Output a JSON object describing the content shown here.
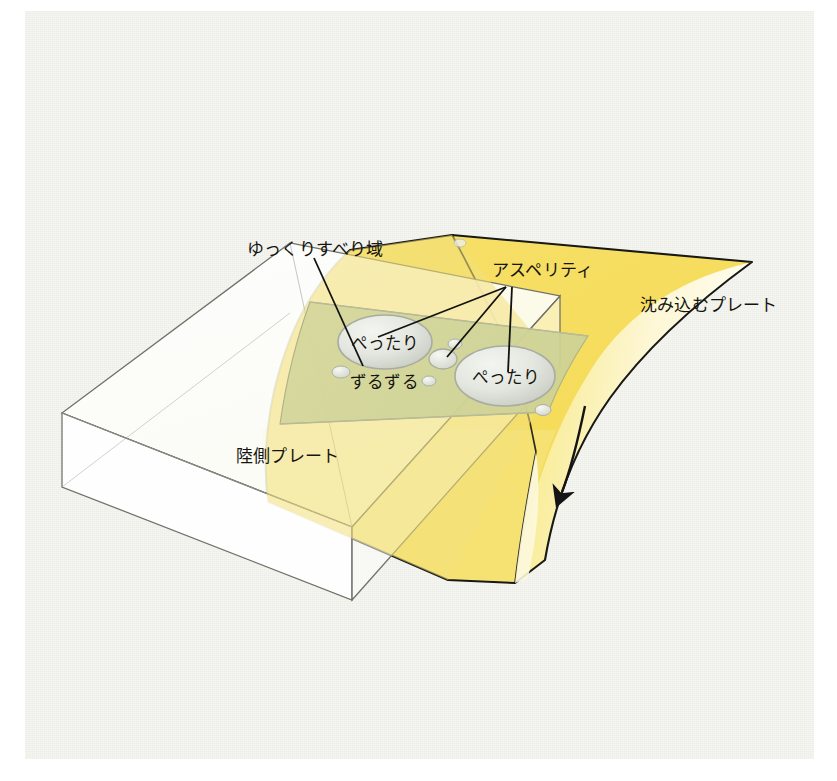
{
  "figure": {
    "title_visible": false,
    "background_color": "#eceee7",
    "outer_margin_color": "#ffffff"
  },
  "colors": {
    "slab_top_bright": "#f5dd5c",
    "slab_top_mid": "#f4e27e",
    "slab_face_light": "#faf4cf",
    "slab_side_deep": "#f2d552",
    "slow_slip_band": "#d7d79a",
    "asperity_fill": "#e3e6df",
    "land_plate_fill": "#fbfdf6",
    "outline": "#1a1a18",
    "thin_outline": "#6e7068",
    "text": "#16140f"
  },
  "labels": {
    "slow_slip_zone": "ゆっくりすべり域",
    "asperity": "アスペリティ",
    "subducting_plate": "沈み込むプレート",
    "land_plate": "陸側プレート",
    "stuck_left": "ぺったり",
    "stuck_right": "ぺったり",
    "slipping": "ずるずる"
  },
  "annotations": {
    "subduction_arrow": "downward-motion-arrow",
    "leader_lines": 4,
    "asperity_leader_targets": 3
  },
  "elements": {
    "land_plate_block": "transparent rectangular slab block",
    "subducting_slab": "curved bending plate descending to the right",
    "slow_slip_band": "greenish translucent band across slab surface",
    "asperity_large_left": "ぺったり",
    "asperity_large_right": "ぺったり",
    "asperity_small_center": "small asperity patch",
    "small_patches_count": 6
  }
}
